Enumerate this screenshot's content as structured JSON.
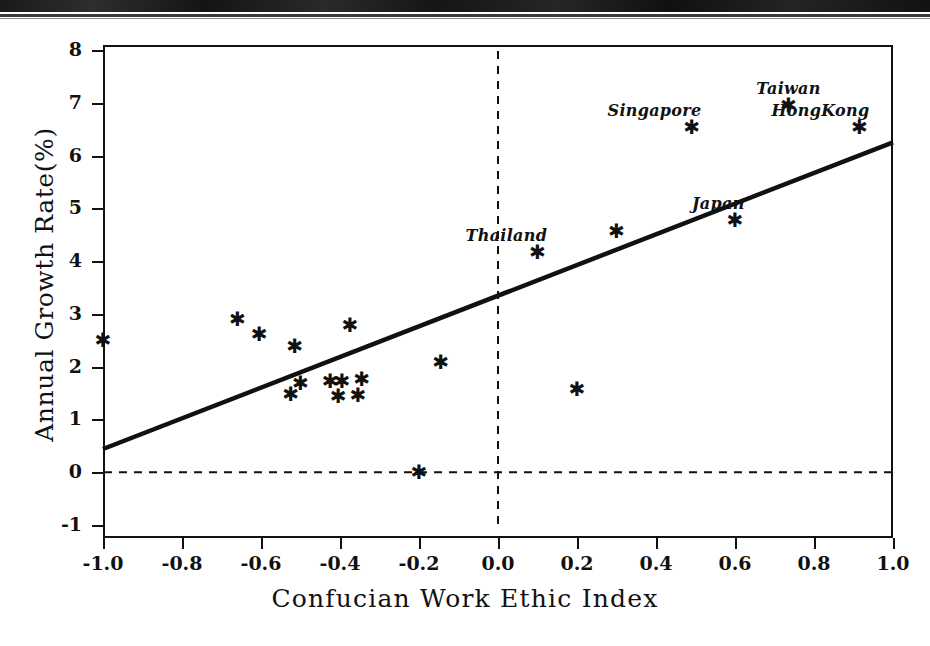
{
  "figure": {
    "xaxis_title": "Confucian Work Ethic Index",
    "yaxis_title": "Annual Growth Rate(%)",
    "marker_glyph": "✱"
  },
  "chart_data": {
    "type": "scatter",
    "title": "",
    "xlabel": "Confucian Work Ethic Index",
    "ylabel": "Annual Growth Rate(%)",
    "xlim": [
      -1.0,
      1.0
    ],
    "ylim": [
      -1,
      8
    ],
    "xticks": [
      "-1.0",
      "-0.8",
      "-0.6",
      "-0.4",
      "-0.2",
      "0.0",
      "0.2",
      "0.4",
      "0.6",
      "0.8",
      "1.0"
    ],
    "xtick_values": [
      -1.0,
      -0.8,
      -0.6,
      -0.4,
      -0.2,
      0.0,
      0.2,
      0.4,
      0.6,
      0.8,
      1.0
    ],
    "yticks": [
      "-1",
      "0",
      "1",
      "2",
      "3",
      "4",
      "5",
      "6",
      "7",
      "8"
    ],
    "ytick_values": [
      -1,
      0,
      1,
      2,
      3,
      4,
      5,
      6,
      7,
      8
    ],
    "grid": false,
    "legend": "none",
    "reference_lines": [
      {
        "name": "zero-growth-line",
        "orientation": "horizontal",
        "value": 0,
        "style": "dashed"
      },
      {
        "name": "zero-index-line",
        "orientation": "vertical",
        "value": 0,
        "style": "dashed"
      }
    ],
    "fit_line": {
      "name": "regression-line",
      "style": "solid",
      "x0": -1.0,
      "y0": 0.44,
      "x1": 1.0,
      "y1": 6.25,
      "slope": 2.905,
      "intercept": 3.345
    },
    "points": [
      {
        "x": -1.0,
        "y": 2.5,
        "label": ""
      },
      {
        "x": -0.66,
        "y": 2.9,
        "label": ""
      },
      {
        "x": -0.605,
        "y": 2.61,
        "label": ""
      },
      {
        "x": -0.515,
        "y": 2.39,
        "label": ""
      },
      {
        "x": -0.375,
        "y": 2.79,
        "label": ""
      },
      {
        "x": -0.5,
        "y": 1.7,
        "label": ""
      },
      {
        "x": -0.525,
        "y": 1.49,
        "label": ""
      },
      {
        "x": -0.425,
        "y": 1.73,
        "label": ""
      },
      {
        "x": -0.395,
        "y": 1.73,
        "label": ""
      },
      {
        "x": -0.345,
        "y": 1.77,
        "label": ""
      },
      {
        "x": -0.405,
        "y": 1.45,
        "label": ""
      },
      {
        "x": -0.355,
        "y": 1.46,
        "label": ""
      },
      {
        "x": -0.145,
        "y": 2.08,
        "label": ""
      },
      {
        "x": -0.2,
        "y": 0.0,
        "label": ""
      },
      {
        "x": 0.1,
        "y": 4.17,
        "label": "Thailand"
      },
      {
        "x": 0.2,
        "y": 1.58,
        "label": ""
      },
      {
        "x": 0.3,
        "y": 4.58,
        "label": ""
      },
      {
        "x": 0.49,
        "y": 6.55,
        "label": "Singapore"
      },
      {
        "x": 0.6,
        "y": 4.77,
        "label": "Japan"
      },
      {
        "x": 0.735,
        "y": 6.95,
        "label": "Taiwan"
      },
      {
        "x": 0.915,
        "y": 6.55,
        "label": "HongKong"
      }
    ],
    "labels": [
      {
        "text": "Thailand",
        "x": 0.1,
        "y": 4.17,
        "anchor": "above-left"
      },
      {
        "text": "Singapore",
        "x": 0.49,
        "y": 6.55,
        "anchor": "above-left"
      },
      {
        "text": "Japan",
        "x": 0.6,
        "y": 4.77,
        "anchor": "above-left"
      },
      {
        "text": "Taiwan",
        "x": 0.735,
        "y": 6.95,
        "anchor": "above"
      },
      {
        "text": "HongKong",
        "x": 0.915,
        "y": 6.55,
        "anchor": "above-left"
      }
    ]
  }
}
